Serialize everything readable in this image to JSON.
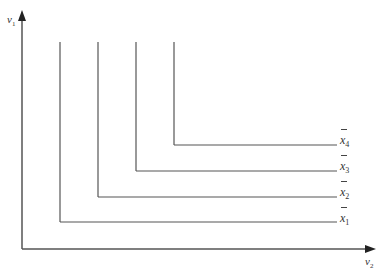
{
  "diagram": {
    "axes": {
      "y_label": "v",
      "y_label_sub": "1",
      "x_label": "v",
      "x_label_sub": "2",
      "origin": [
        22,
        249
      ],
      "y_top": 10,
      "x_right": 376
    },
    "curves": [
      {
        "label": "x",
        "sub": "1",
        "corner_x": 60,
        "corner_y": 222,
        "top_y": 42,
        "right_x": 337
      },
      {
        "label": "x",
        "sub": "2",
        "corner_x": 98,
        "corner_y": 197,
        "top_y": 42,
        "right_x": 337
      },
      {
        "label": "x",
        "sub": "3",
        "corner_x": 136,
        "corner_y": 171,
        "top_y": 42,
        "right_x": 337
      },
      {
        "label": "x",
        "sub": "4",
        "corner_x": 174,
        "corner_y": 145,
        "top_y": 42,
        "right_x": 337
      }
    ],
    "line_color": "#555555"
  }
}
